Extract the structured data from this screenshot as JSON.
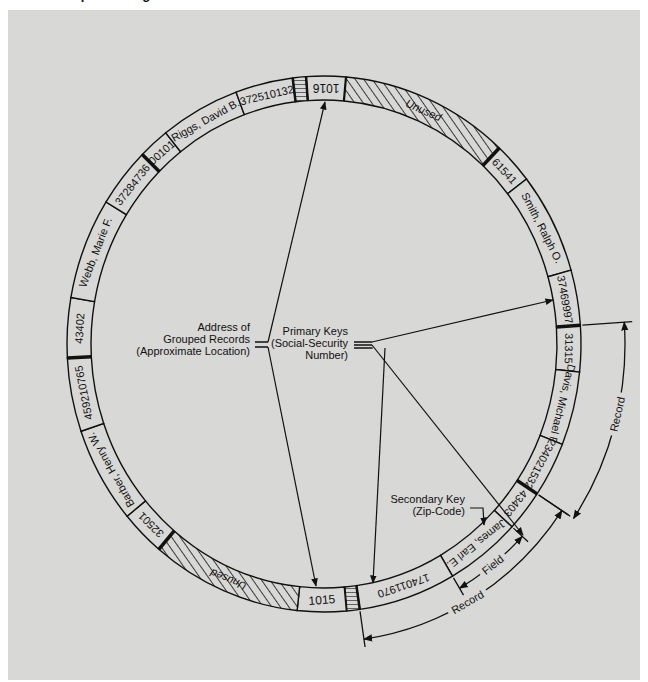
{
  "title": "...processing",
  "colors": {
    "background": "#d8d8d6",
    "ring_fill": "#d8d8d6",
    "ink": "#111111"
  },
  "ring": {
    "segments": [
      {
        "type": "address",
        "label": "1016",
        "start": -4,
        "end": 5,
        "bold_end": true
      },
      {
        "type": "unused",
        "label": "Unused",
        "start": 5,
        "end": 43
      },
      {
        "type": "key",
        "label": "61541",
        "start": 43,
        "end": 52,
        "bold_start": true
      },
      {
        "type": "name",
        "label": "Smith, Ralph O.",
        "start": 52,
        "end": 74
      },
      {
        "type": "key",
        "label": "37469997",
        "start": 74,
        "end": 86
      },
      {
        "type": "key",
        "label": "31315",
        "start": 86,
        "end": 96,
        "bold_start": true
      },
      {
        "type": "name",
        "label": "Davis, Michael R.",
        "start": 96,
        "end": 112
      },
      {
        "type": "key",
        "label": "234021532",
        "start": 112,
        "end": 124
      },
      {
        "type": "key",
        "label": "43403",
        "start": 124,
        "end": 133,
        "bold_start": true
      },
      {
        "type": "name",
        "label": "James, Earl E.",
        "start": 133,
        "end": 150
      },
      {
        "type": "key",
        "label": "174011970",
        "start": 150,
        "end": 172
      },
      {
        "type": "marker",
        "label": "",
        "start": 172,
        "end": 175
      },
      {
        "type": "address",
        "label": "1015",
        "start": 175,
        "end": 186
      },
      {
        "type": "unused",
        "label": "Unused",
        "start": 186,
        "end": 220
      },
      {
        "type": "key",
        "label": "32501",
        "start": 220,
        "end": 230,
        "bold_start": true
      },
      {
        "type": "name",
        "label": "Barber, Henry W.",
        "start": 230,
        "end": 251
      },
      {
        "type": "key",
        "label": "459210765",
        "start": 251,
        "end": 267
      },
      {
        "type": "key",
        "label": "43402",
        "start": 267,
        "end": 280,
        "bold_start": true
      },
      {
        "type": "name",
        "label": "Webb, Marie F.",
        "start": 280,
        "end": 302
      },
      {
        "type": "key",
        "label": "37284736",
        "start": 302,
        "end": 315
      },
      {
        "type": "key",
        "label": "00101",
        "start": 315,
        "end": 322,
        "bold_start": true
      },
      {
        "type": "name",
        "label": "Riggs, David B.",
        "start": 322,
        "end": 340
      },
      {
        "type": "key",
        "label": "372510132",
        "start": 340,
        "end": 353
      },
      {
        "type": "marker",
        "label": "",
        "start": 353,
        "end": 356
      }
    ]
  },
  "callouts": {
    "address": {
      "lines": [
        "Address of",
        "Grouped Records",
        "(Approximate Location)"
      ]
    },
    "primary": {
      "lines": [
        "Primary Keys",
        "(Social-Security",
        "Number)"
      ]
    },
    "secondary": {
      "lines": [
        "Secondary Key",
        "(Zip-Code)"
      ]
    }
  },
  "dimensions": {
    "field_label": "Field",
    "record_inner_label": "Record",
    "record_outer_label": "Record"
  }
}
